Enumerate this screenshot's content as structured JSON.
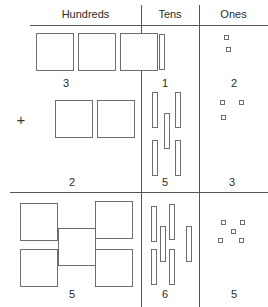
{
  "headers": {
    "hundreds": "Hundreds",
    "tens": "Tens",
    "ones": "Ones"
  },
  "operator": "+",
  "rows": [
    {
      "name": "addend-1",
      "digits": {
        "hundreds": "3",
        "tens": "1",
        "ones": "2"
      },
      "counts": {
        "hundreds": 3,
        "tens": 1,
        "ones": 2
      }
    },
    {
      "name": "addend-2",
      "digits": {
        "hundreds": "2",
        "tens": "5",
        "ones": "3"
      },
      "counts": {
        "hundreds": 2,
        "tens": 5,
        "ones": 3
      }
    },
    {
      "name": "sum",
      "digits": {
        "hundreds": "5",
        "tens": "6",
        "ones": "5"
      },
      "counts": {
        "hundreds": 5,
        "tens": 6,
        "ones": 5
      }
    }
  ],
  "digit_labels": {
    "r1_hundreds": "3",
    "r1_tens": "1",
    "r1_ones": "2",
    "r2_hundreds": "2",
    "r2_tens": "5",
    "r2_ones": "3",
    "r3_hundreds": "5",
    "r3_tens": "6",
    "r3_ones": "5"
  },
  "colors": {
    "line": "#555555",
    "block_stroke": "#6e6e6e",
    "text": "#2b2b2b",
    "background": "#ffffff"
  }
}
